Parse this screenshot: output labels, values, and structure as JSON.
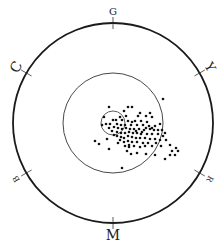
{
  "diagram": {
    "type": "polar-scatter",
    "center": [
      113,
      123
    ],
    "outer_radius": 100,
    "middle_radius": 50,
    "inner_radius": 12,
    "hue_labels": [
      {
        "text": "G",
        "angle": 90,
        "size": 10
      },
      {
        "text": "Y",
        "angle": 30,
        "size": 13
      },
      {
        "text": "R",
        "angle": -30,
        "size": 8
      },
      {
        "text": "M",
        "angle": -90,
        "size": 14
      },
      {
        "text": "B",
        "angle": -150,
        "size": 8
      },
      {
        "text": "C",
        "angle": 150,
        "size": 14
      }
    ],
    "colors": {
      "line": "#1a1a1a",
      "dot": "#111111",
      "background": "#ffffff"
    },
    "points": [
      [
        163,
        99
      ],
      [
        109,
        107
      ],
      [
        128,
        107
      ],
      [
        132,
        107
      ],
      [
        124,
        111
      ],
      [
        150,
        113
      ],
      [
        146,
        116
      ],
      [
        138,
        116
      ],
      [
        152,
        117
      ],
      [
        104,
        117
      ],
      [
        116,
        120
      ],
      [
        122,
        120
      ],
      [
        128,
        121
      ],
      [
        135,
        121
      ],
      [
        141,
        121
      ],
      [
        147,
        122
      ],
      [
        106,
        124
      ],
      [
        110,
        124
      ],
      [
        117,
        124
      ],
      [
        121,
        125
      ],
      [
        125,
        125
      ],
      [
        131,
        125
      ],
      [
        137,
        125
      ],
      [
        143,
        125
      ],
      [
        149,
        126
      ],
      [
        155,
        126
      ],
      [
        160,
        124
      ],
      [
        114,
        127
      ],
      [
        118,
        128
      ],
      [
        122,
        129
      ],
      [
        126,
        128
      ],
      [
        130,
        129
      ],
      [
        134,
        129
      ],
      [
        139,
        129
      ],
      [
        144,
        130
      ],
      [
        150,
        129
      ],
      [
        154,
        130
      ],
      [
        162,
        130
      ],
      [
        165,
        133
      ],
      [
        112,
        131
      ],
      [
        117,
        132
      ],
      [
        121,
        133
      ],
      [
        125,
        133
      ],
      [
        129,
        132
      ],
      [
        133,
        133
      ],
      [
        137,
        133
      ],
      [
        141,
        134
      ],
      [
        147,
        134
      ],
      [
        152,
        134
      ],
      [
        158,
        134
      ],
      [
        163,
        136
      ],
      [
        117,
        136
      ],
      [
        121,
        137
      ],
      [
        124,
        138
      ],
      [
        128,
        136
      ],
      [
        132,
        137
      ],
      [
        136,
        138
      ],
      [
        140,
        138
      ],
      [
        145,
        138
      ],
      [
        150,
        139
      ],
      [
        155,
        139
      ],
      [
        160,
        140
      ],
      [
        120,
        140
      ],
      [
        124,
        142
      ],
      [
        128,
        141
      ],
      [
        132,
        142
      ],
      [
        137,
        142
      ],
      [
        143,
        143
      ],
      [
        148,
        143
      ],
      [
        152,
        146
      ],
      [
        107,
        139
      ],
      [
        95,
        141
      ],
      [
        99,
        144
      ],
      [
        125,
        146
      ],
      [
        129,
        147
      ],
      [
        134,
        146
      ],
      [
        140,
        147
      ],
      [
        145,
        146
      ],
      [
        170,
        145
      ],
      [
        176,
        148
      ],
      [
        178,
        151
      ],
      [
        172,
        151
      ],
      [
        175,
        155
      ],
      [
        170,
        155
      ],
      [
        109,
        149
      ],
      [
        127,
        151
      ],
      [
        131,
        154
      ],
      [
        137,
        153
      ],
      [
        146,
        154
      ],
      [
        155,
        155
      ],
      [
        165,
        159
      ],
      [
        122,
        168
      ],
      [
        129,
        145
      ],
      [
        118,
        143
      ],
      [
        114,
        135
      ],
      [
        109,
        128
      ],
      [
        102,
        125
      ],
      [
        140,
        113
      ],
      [
        152,
        128
      ],
      [
        158,
        130
      ],
      [
        156,
        143
      ],
      [
        161,
        146
      ],
      [
        136,
        131
      ],
      [
        120,
        117
      ],
      [
        113,
        120
      ],
      [
        126,
        116
      ],
      [
        146,
        128
      ],
      [
        142,
        132
      ],
      [
        166,
        140
      ],
      [
        132,
        122
      ]
    ]
  }
}
